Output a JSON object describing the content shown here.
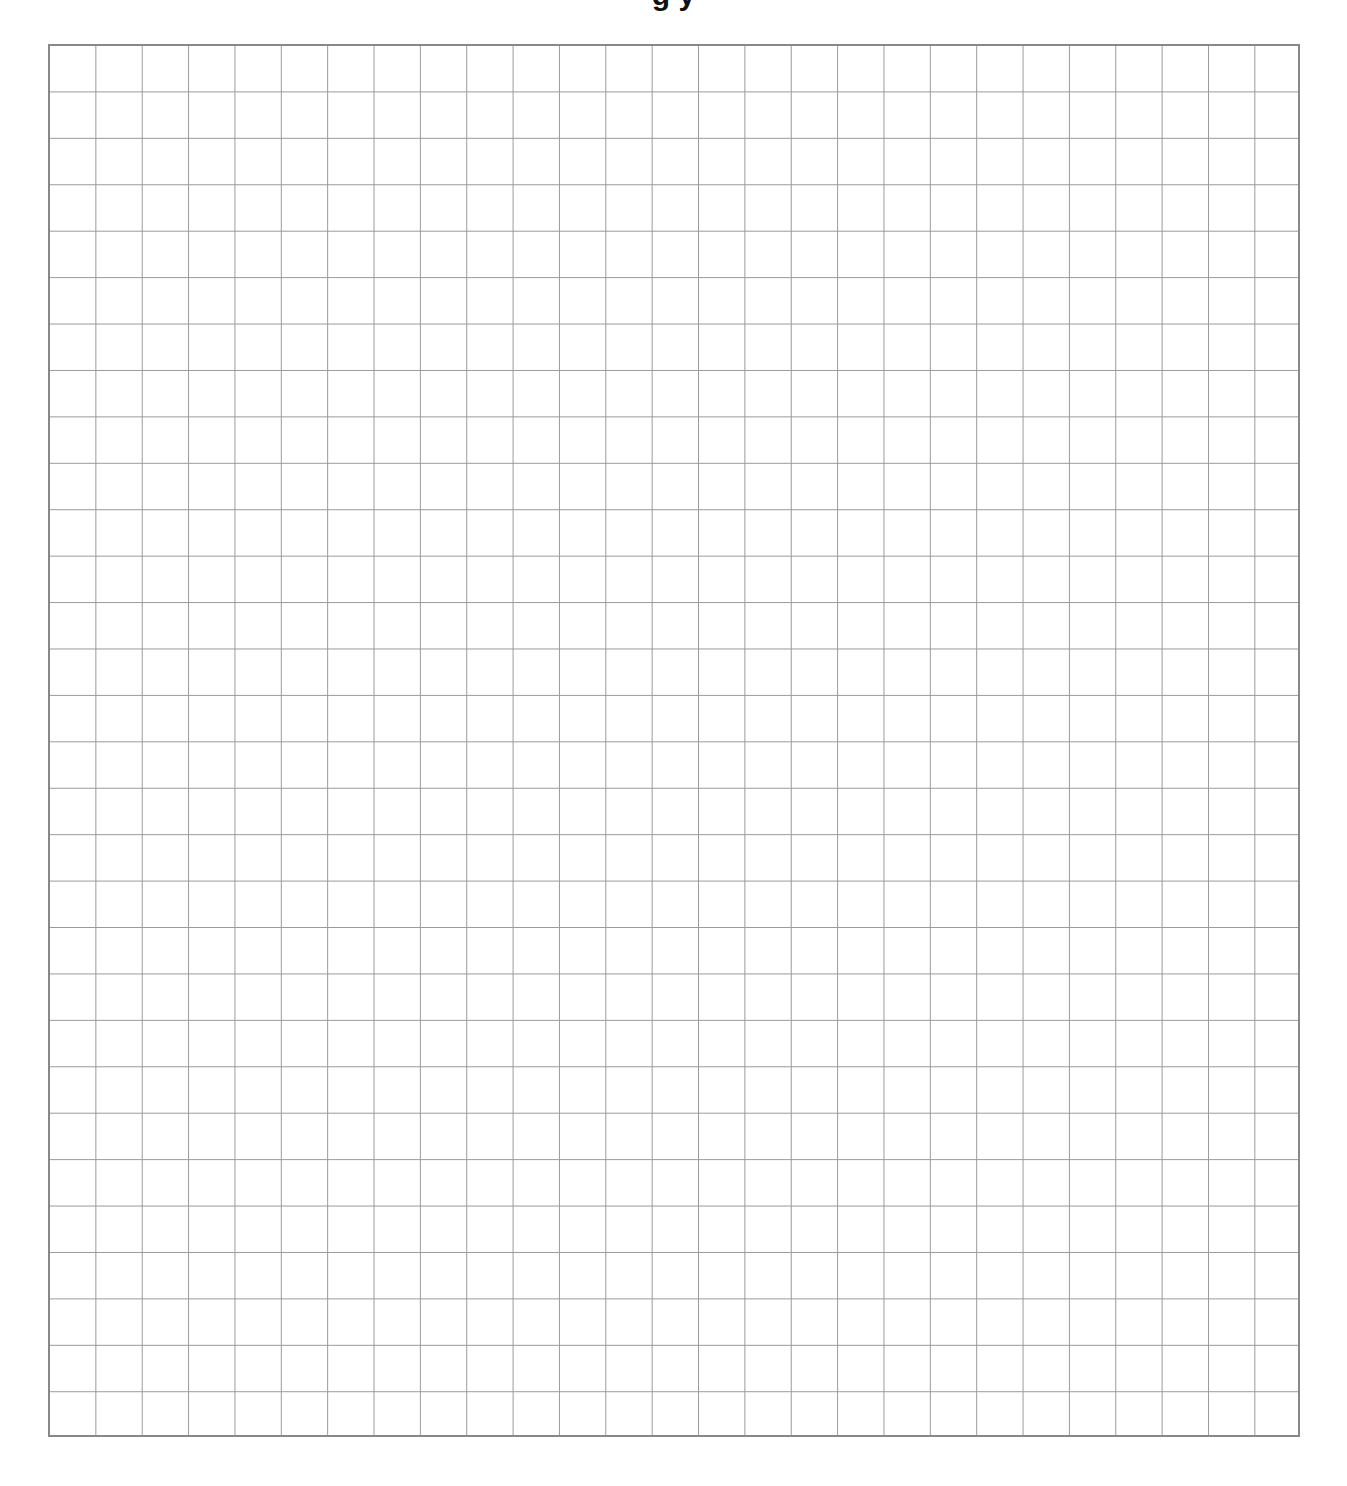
{
  "page": {
    "title_partial": "g y",
    "grid": {
      "columns": 27,
      "rows": 30,
      "line_color": "#999999",
      "border_color": "#888888"
    }
  }
}
